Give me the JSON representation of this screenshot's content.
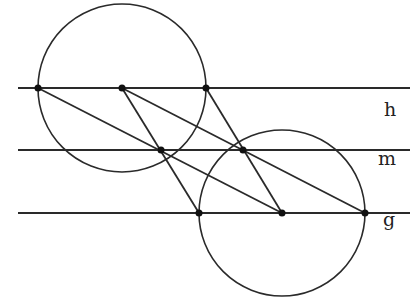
{
  "diagram": {
    "stroke": "#2a2a2a",
    "lines": [
      {
        "name": "h",
        "y": 88,
        "x1": 18,
        "x2": 410,
        "label": "h",
        "label_x": 384,
        "label_y": 98
      },
      {
        "name": "m",
        "y": 150,
        "x1": 18,
        "x2": 410,
        "label": "m",
        "label_x": 378,
        "label_y": 147
      },
      {
        "name": "g",
        "y": 213,
        "x1": 18,
        "x2": 410,
        "label": "g",
        "label_x": 383,
        "label_y": 208
      }
    ],
    "circles": [
      {
        "cx": 122,
        "cy": 88,
        "r": 84
      },
      {
        "cx": 282,
        "cy": 213,
        "r": 83
      }
    ],
    "points": [
      [
        38,
        88
      ],
      [
        122,
        88
      ],
      [
        206,
        88
      ],
      [
        161,
        150
      ],
      [
        243,
        150
      ],
      [
        199,
        213
      ],
      [
        282,
        213
      ],
      [
        365,
        213
      ]
    ],
    "segments": [
      [
        38,
        88,
        282,
        213
      ],
      [
        122,
        88,
        199,
        213
      ],
      [
        122,
        88,
        365,
        213
      ],
      [
        206,
        88,
        282,
        213
      ]
    ]
  }
}
